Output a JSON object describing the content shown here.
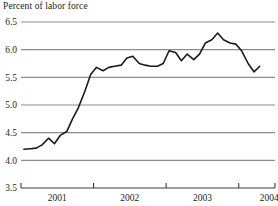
{
  "chart_data": {
    "type": "line",
    "title": "Percent of labor force",
    "xlabel": "",
    "ylabel": "",
    "ylim": [
      3.5,
      6.5
    ],
    "ytick_values": [
      3.5,
      4.0,
      4.5,
      5.0,
      5.5,
      6.0,
      6.5
    ],
    "ytick_labels": [
      "3.5",
      "4.0",
      "4.5",
      "5.0",
      "5.5",
      "6.0",
      "6.5"
    ],
    "xlim": [
      2000.5,
      2004.0
    ],
    "xtick_values": [
      2000.5,
      2001.5,
      2002.5,
      2003.5,
      2004.0
    ],
    "xtick_labels": [
      "2001",
      "2002",
      "2003",
      "2004"
    ],
    "xtick_label_positions": [
      2001.0,
      2002.0,
      2003.0,
      2003.92
    ],
    "grid": true,
    "grid_axis": "y",
    "legend": "none",
    "line_color": "#1a1a1a",
    "line_width": 1.6,
    "grid_color": "#8c8c8c",
    "series": [
      {
        "name": "Unemployment rate",
        "x": [
          2000.54,
          2000.63,
          2000.71,
          2000.79,
          2000.88,
          2000.96,
          2001.04,
          2001.13,
          2001.21,
          2001.29,
          2001.38,
          2001.46,
          2001.54,
          2001.63,
          2001.71,
          2001.79,
          2001.88,
          2001.96,
          2002.04,
          2002.13,
          2002.21,
          2002.29,
          2002.38,
          2002.46,
          2002.54,
          2002.63,
          2002.71,
          2002.79,
          2002.88,
          2002.96,
          2003.04,
          2003.13,
          2003.21,
          2003.29,
          2003.38,
          2003.46,
          2003.54,
          2003.63,
          2003.71,
          2003.79
        ],
        "values": [
          4.2,
          4.21,
          4.22,
          4.28,
          4.4,
          4.3,
          4.45,
          4.52,
          4.75,
          4.95,
          5.25,
          5.55,
          5.68,
          5.62,
          5.68,
          5.7,
          5.72,
          5.85,
          5.88,
          5.75,
          5.72,
          5.7,
          5.7,
          5.75,
          5.98,
          5.95,
          5.8,
          5.92,
          5.82,
          5.92,
          6.12,
          6.18,
          6.3,
          6.18,
          6.12,
          6.1,
          5.98,
          5.75,
          5.6,
          5.7
        ]
      }
    ]
  }
}
